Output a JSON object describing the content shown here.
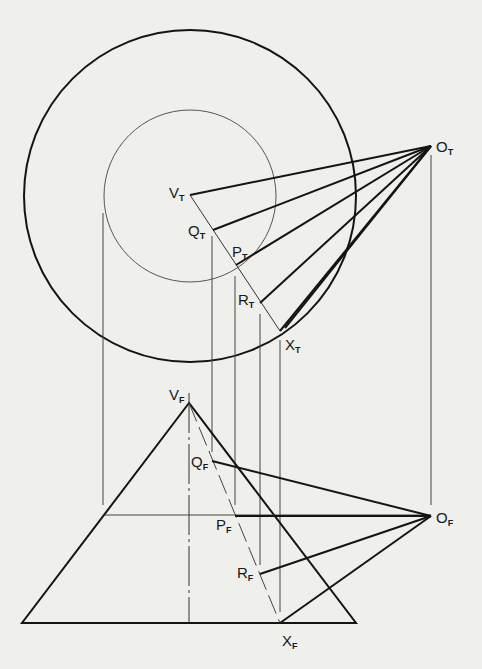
{
  "diagram": {
    "type": "orthographic-projection",
    "views": [
      "top",
      "front"
    ],
    "colors": {
      "background": "#efefec",
      "ink": "#141414",
      "thin": "#3a3a3a"
    },
    "top_view": {
      "outer_circle": {
        "cx": 190,
        "cy": 196,
        "r": 166
      },
      "inner_circle": {
        "cx": 190,
        "cy": 196,
        "r": 86
      },
      "labels": [
        {
          "id": "O_T",
          "main": "O",
          "sub": "T",
          "x": 436,
          "y": 152
        },
        {
          "id": "V_T",
          "main": "V",
          "sub": "T",
          "x": 169,
          "y": 198
        },
        {
          "id": "Q_T",
          "main": "Q",
          "sub": "T",
          "x": 188,
          "y": 236
        },
        {
          "id": "P_T",
          "main": "P",
          "sub": "T",
          "x": 232,
          "y": 257
        },
        {
          "id": "R_T",
          "main": "R",
          "sub": "T",
          "x": 238,
          "y": 305
        },
        {
          "id": "X_T",
          "main": "X",
          "sub": "T",
          "x": 285,
          "y": 350
        }
      ]
    },
    "front_view": {
      "triangle": {
        "apex": [
          189,
          403
        ],
        "base_left": [
          22,
          623
        ],
        "base_right": [
          356,
          623
        ]
      },
      "labels": [
        {
          "id": "V_F",
          "main": "V",
          "sub": "F",
          "x": 169,
          "y": 400
        },
        {
          "id": "Q_F",
          "main": "Q",
          "sub": "F",
          "x": 191,
          "y": 467
        },
        {
          "id": "P_F",
          "main": "P",
          "sub": "F",
          "x": 216,
          "y": 530
        },
        {
          "id": "R_F",
          "main": "R",
          "sub": "F",
          "x": 237,
          "y": 578
        },
        {
          "id": "O_F",
          "main": "O",
          "sub": "F",
          "x": 436,
          "y": 523
        },
        {
          "id": "X_F",
          "main": "X",
          "sub": "F",
          "x": 282,
          "y": 646
        }
      ]
    }
  }
}
